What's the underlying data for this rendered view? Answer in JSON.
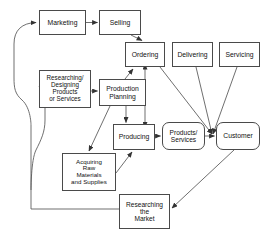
{
  "diagram": {
    "type": "flowchart",
    "background_color": "#ffffff",
    "node_border_color": "#4a4a4a",
    "edge_color": "#555555",
    "text_color": "#111111"
  },
  "nodes": [
    {
      "id": "marketing",
      "label": "Marketing",
      "shape": "rectangle",
      "x": 39,
      "y": 10,
      "width": 47,
      "height": 25,
      "font_size": 6.8
    },
    {
      "id": "selling",
      "label": "Selling",
      "shape": "rectangle",
      "x": 99,
      "y": 10,
      "width": 42,
      "height": 25,
      "font_size": 6.8
    },
    {
      "id": "ordering",
      "label": "Ordering",
      "shape": "rectangle",
      "x": 125,
      "y": 42,
      "width": 40,
      "height": 25,
      "font_size": 6.8
    },
    {
      "id": "delivering",
      "label": "Delivering",
      "shape": "rectangle",
      "x": 172,
      "y": 42,
      "width": 41,
      "height": 25,
      "font_size": 6.8
    },
    {
      "id": "servicing",
      "label": "Servicing",
      "shape": "rectangle",
      "x": 219,
      "y": 42,
      "width": 41,
      "height": 25,
      "font_size": 6.8
    },
    {
      "id": "researching-designing",
      "label": "Researching/\nDesigning\nProducts\nor Services",
      "shape": "rectangle",
      "x": 39,
      "y": 70,
      "width": 52,
      "height": 38,
      "font_size": 6.3
    },
    {
      "id": "production-planning",
      "label": "Production\nPlanning",
      "shape": "rectangle",
      "x": 99,
      "y": 79,
      "width": 47,
      "height": 27,
      "font_size": 6.8
    },
    {
      "id": "producing",
      "label": "Producing",
      "shape": "rectangle",
      "x": 113,
      "y": 124,
      "width": 42,
      "height": 26,
      "font_size": 6.8
    },
    {
      "id": "products-services",
      "label": "Products/\nServices",
      "shape": "rounded-rectangle",
      "x": 162,
      "y": 122,
      "width": 43,
      "height": 28,
      "font_size": 6.6
    },
    {
      "id": "customer",
      "label": "Customer",
      "shape": "rounded-rectangle",
      "x": 216,
      "y": 122,
      "width": 44,
      "height": 28,
      "font_size": 6.8
    },
    {
      "id": "acquiring-raw-materials",
      "label": "Acquiring\nRaw\nMaterials\nand Supplies",
      "shape": "rectangle",
      "x": 62,
      "y": 153,
      "width": 54,
      "height": 38,
      "font_size": 6.2
    },
    {
      "id": "researching-the-market",
      "label": "Researching\nthe\nMarket",
      "shape": "rectangle",
      "x": 119,
      "y": 194,
      "width": 51,
      "height": 35,
      "font_size": 6.6
    }
  ],
  "edges": [
    {
      "id": "marketing-to-selling",
      "from": "marketing",
      "to": "selling",
      "style": "straight",
      "arrow": "single"
    },
    {
      "id": "selling-to-ordering",
      "from": "selling",
      "to": "ordering",
      "style": "straight",
      "arrow": "single"
    },
    {
      "id": "researching-designing-to-production-planning",
      "from": "researching-designing",
      "to": "production-planning",
      "style": "straight",
      "arrow": "single"
    },
    {
      "id": "production-planning-to-ordering",
      "from": "production-planning",
      "to": "ordering",
      "style": "straight",
      "arrow": "single"
    },
    {
      "id": "producing-to-ordering",
      "from": "producing",
      "to": "ordering",
      "style": "straight",
      "arrow": "double"
    },
    {
      "id": "production-planning-to-producing",
      "from": "production-planning",
      "to": "producing",
      "style": "straight",
      "arrow": "single"
    },
    {
      "id": "production-planning-to-acquiring",
      "from": "production-planning",
      "to": "acquiring-raw-materials",
      "style": "straight",
      "arrow": "single"
    },
    {
      "id": "acquiring-to-producing",
      "from": "acquiring-raw-materials",
      "to": "producing",
      "style": "straight",
      "arrow": "single"
    },
    {
      "id": "producing-to-products-services",
      "from": "producing",
      "to": "products-services",
      "style": "straight",
      "arrow": "single"
    },
    {
      "id": "products-services-to-customer",
      "from": "products-services",
      "to": "customer",
      "style": "straight",
      "arrow": "single"
    },
    {
      "id": "ordering-to-customer",
      "from": "ordering",
      "to": "customer",
      "style": "straight",
      "arrow": "single"
    },
    {
      "id": "delivering-to-customer",
      "from": "delivering",
      "to": "customer",
      "style": "straight",
      "arrow": "single"
    },
    {
      "id": "servicing-to-customer",
      "from": "servicing",
      "to": "customer",
      "style": "straight",
      "arrow": "single"
    },
    {
      "id": "customer-to-researching-the-market",
      "from": "customer",
      "to": "researching-the-market",
      "style": "straight",
      "arrow": "single"
    },
    {
      "id": "researching-the-market-to-marketing",
      "from": "researching-the-market",
      "to": "marketing",
      "style": "orthogonal-curved",
      "arrow": "single"
    },
    {
      "id": "feedback-to-researching-designing",
      "from": "researching-the-market",
      "to": "researching-designing",
      "style": "orthogonal-curved",
      "arrow": "single"
    }
  ]
}
